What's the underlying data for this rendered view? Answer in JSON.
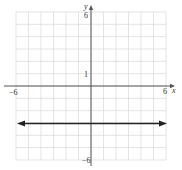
{
  "chart_data": {
    "type": "line",
    "title": "",
    "xlabel": "x",
    "ylabel": "y",
    "xlim": [
      -6,
      6
    ],
    "ylim": [
      -6,
      6
    ],
    "grid": true,
    "tick_labels": {
      "x_min": "−6",
      "x_max": "6",
      "y_max": "6",
      "y_min": "−6",
      "y_unit": "1"
    },
    "series": [
      {
        "name": "y = -3",
        "equation": "y = -3",
        "x": [
          -6,
          6
        ],
        "y": [
          -3,
          -3
        ],
        "arrows": "both"
      }
    ],
    "colors": {
      "grid": "#d9d9d9",
      "axis": "#555555",
      "line": "#222222"
    }
  }
}
